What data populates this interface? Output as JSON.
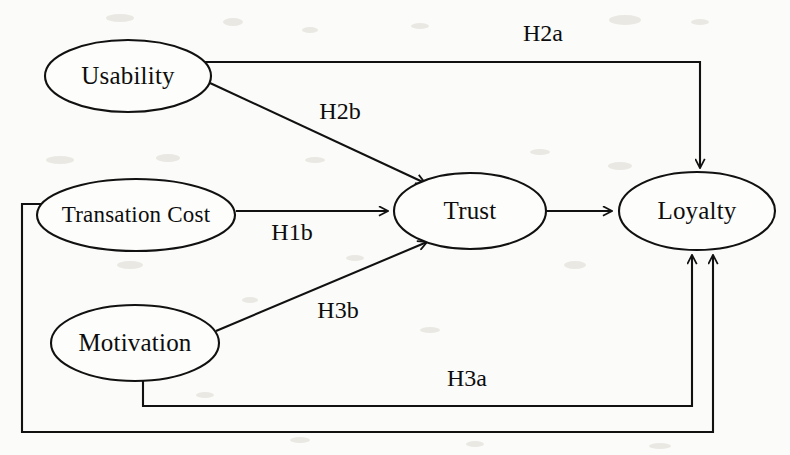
{
  "diagram": {
    "type": "path-model",
    "background_color": "#fbfbf9",
    "line_color": "#111111",
    "text_color": "#0d0d0d",
    "nodes": [
      {
        "id": "usability",
        "label": "Usability",
        "shape": "ellipse",
        "cx": 128,
        "cy": 76,
        "rx": 83,
        "ry": 36
      },
      {
        "id": "transaction",
        "label": "Transation Cost",
        "shape": "ellipse",
        "cx": 136,
        "cy": 215,
        "rx": 99,
        "ry": 36
      },
      {
        "id": "motivation",
        "label": "Motivation",
        "shape": "ellipse",
        "cx": 135,
        "cy": 343,
        "rx": 84,
        "ry": 38
      },
      {
        "id": "trust",
        "label": "Trust",
        "shape": "ellipse",
        "cx": 470,
        "cy": 211,
        "rx": 76,
        "ry": 38
      },
      {
        "id": "loyalty",
        "label": "Loyalty",
        "shape": "ellipse",
        "cx": 697,
        "cy": 211,
        "rx": 78,
        "ry": 39
      }
    ],
    "edges": [
      {
        "id": "h2a",
        "label": "H2a",
        "from": "usability",
        "to": "loyalty",
        "label_x": 543,
        "label_y": 35,
        "routing": "orthogonal-top"
      },
      {
        "id": "h2b",
        "label": "H2b",
        "from": "usability",
        "to": "trust",
        "label_x": 340,
        "label_y": 113,
        "routing": "diagonal"
      },
      {
        "id": "h1b",
        "label": "H1b",
        "from": "transaction",
        "to": "trust",
        "label_x": 292,
        "label_y": 234,
        "routing": "straight"
      },
      {
        "id": "h3b",
        "label": "H3b",
        "from": "motivation",
        "to": "trust",
        "label_x": 338,
        "label_y": 312,
        "routing": "diagonal"
      },
      {
        "id": "h3a",
        "label": "H3a",
        "from": "motivation",
        "to": "loyalty",
        "label_x": 467,
        "label_y": 380,
        "routing": "orthogonal-bottom"
      },
      {
        "id": "h1a",
        "label": "",
        "from": "transaction",
        "to": "loyalty",
        "label_x": 0,
        "label_y": 0,
        "routing": "orthogonal-outer-bottom"
      },
      {
        "id": "trust-loyalty",
        "label": "",
        "from": "trust",
        "to": "loyalty",
        "label_x": 0,
        "label_y": 0,
        "routing": "straight"
      }
    ]
  }
}
